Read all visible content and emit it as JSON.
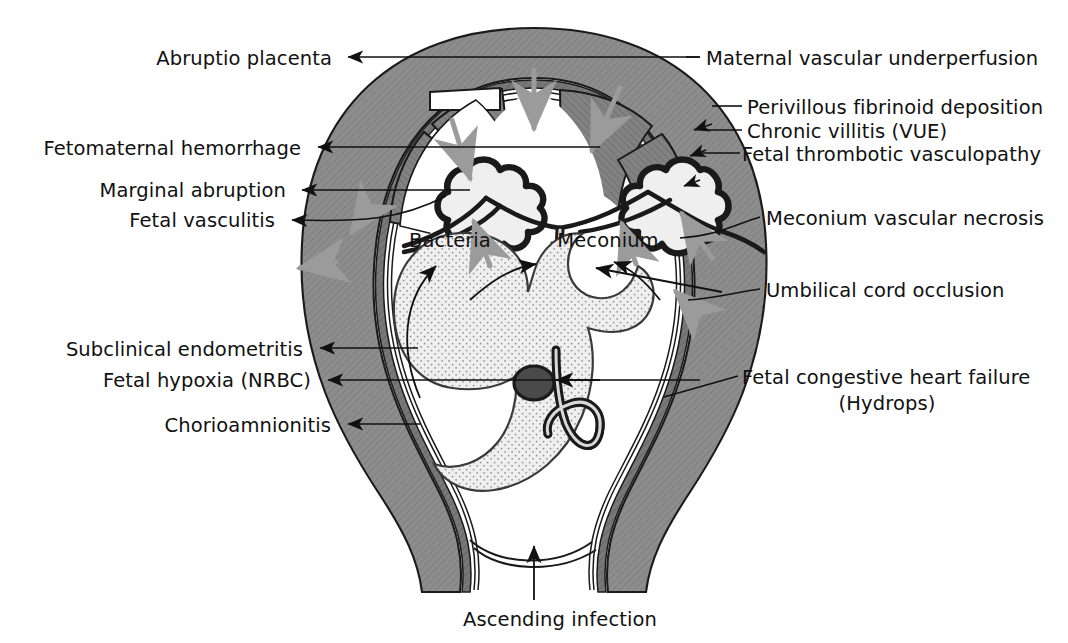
{
  "diagram": {
    "palette": {
      "wall_gray": "#8b8b8b",
      "wall_dark": "#6f6f6f",
      "cotyledon_gray": "#7e7e7e",
      "outline": "#1a1a1a",
      "fetus_stipple": "#ededed",
      "flow_arrow_gray": "#9a9a9a",
      "background": "#ffffff"
    }
  },
  "labels": {
    "left": [
      {
        "id": "abruptio-placenta",
        "text": "Abruptio placenta",
        "x": 332,
        "y": 62,
        "arrow": "straight"
      },
      {
        "id": "fetomaternal-hemorrhage",
        "text": "Fetomaternal hemorrhage",
        "x": 301,
        "y": 152,
        "arrow": "straight"
      },
      {
        "id": "marginal-abruption",
        "text": "Marginal abruption",
        "x": 286,
        "y": 194,
        "arrow": "straight"
      },
      {
        "id": "fetal-vasculitis",
        "text": "Fetal vasculitis",
        "x": 275,
        "y": 224,
        "arrow": "curved"
      },
      {
        "id": "subclinical-endometritis",
        "text": "Subclinical endometritis",
        "x": 303,
        "y": 353,
        "arrow": "straight"
      },
      {
        "id": "fetal-hypoxia-nrbc",
        "text": "Fetal hypoxia (NRBC)",
        "x": 311,
        "y": 384,
        "arrow": "straight"
      },
      {
        "id": "chorioamnionitis",
        "text": "Chorioamnionitis",
        "x": 331,
        "y": 429,
        "arrow": "straight"
      }
    ],
    "right": [
      {
        "id": "maternal-vascular-underperfusion",
        "text": "Maternal vascular underperfusion",
        "x": 706,
        "y": 62,
        "arrow": "straight"
      },
      {
        "id": "perivillous-fibrinoid-deposition",
        "text": "Perivillous fibrinoid deposition",
        "x": 747,
        "y": 111,
        "arrow": "straight"
      },
      {
        "id": "chronic-villitis-vue",
        "text": "Chronic villitis (VUE)",
        "x": 747,
        "y": 135,
        "arrow": "straight"
      },
      {
        "id": "fetal-thrombotic-vasculopathy",
        "text": "Fetal thrombotic vasculopathy",
        "x": 742,
        "y": 158,
        "arrow": "straight"
      },
      {
        "id": "meconium-vascular-necrosis",
        "text": "Meconium vascular necrosis",
        "x": 766,
        "y": 222,
        "arrow": "curved"
      },
      {
        "id": "umbilical-cord-occlusion",
        "text": "Umbilical cord occlusion",
        "x": 766,
        "y": 294,
        "arrow": "curved"
      },
      {
        "id": "fetal-congestive-heart-failure",
        "text": "Fetal congestive heart failure",
        "x": 742,
        "y": 381,
        "arrow": "straight"
      },
      {
        "id": "fetal-congestive-heart-failure-2",
        "text": "(Hydrops)",
        "x": 837,
        "y": 407,
        "arrow": "none"
      }
    ],
    "inner": [
      {
        "id": "bacteria",
        "text": "Bacteria",
        "x": 450,
        "y": 244,
        "arrow": "curved"
      },
      {
        "id": "meconium",
        "text": "Meconium",
        "x": 608,
        "y": 244,
        "arrow": "curved"
      }
    ],
    "bottom": [
      {
        "id": "ascending-infection",
        "text": "Ascending infection",
        "x": 560,
        "y": 625,
        "arrow": "straight-up"
      }
    ]
  }
}
